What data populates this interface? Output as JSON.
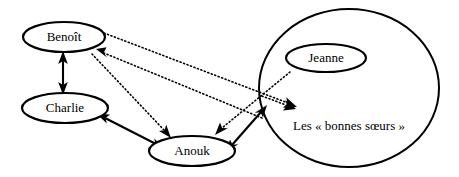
{
  "diagram": {
    "type": "relationship-network-diagram",
    "canvas": {
      "width": 459,
      "height": 177,
      "background": "#ffffff"
    },
    "stroke_color": "#000000",
    "nodes": [
      {
        "id": "benoit",
        "label": "Benoît",
        "shape": "ellipse",
        "cx": 64,
        "cy": 37,
        "rx": 41,
        "ry": 15,
        "font_size": 13
      },
      {
        "id": "charlie",
        "label": "Charlie",
        "shape": "ellipse",
        "cx": 65,
        "cy": 108,
        "rx": 43,
        "ry": 15,
        "font_size": 13
      },
      {
        "id": "anouk",
        "label": "Anouk",
        "shape": "ellipse",
        "cx": 192,
        "cy": 151,
        "rx": 43,
        "ry": 15,
        "font_size": 13
      },
      {
        "id": "jeanne",
        "label": "Jeanne",
        "shape": "ellipse",
        "cx": 326,
        "cy": 58,
        "rx": 40,
        "ry": 14,
        "font_size": 13
      },
      {
        "id": "bonnes-soeurs",
        "label": "Les « bonnes sœurs »",
        "shape": "ellipse",
        "cx": 349,
        "cy": 88,
        "rx": 90,
        "ry": 79,
        "label_cx": 349,
        "label_cy": 127,
        "font_size": 13
      }
    ],
    "edges": [
      {
        "id": "benoit-charlie",
        "from": "benoit",
        "to": "charlie",
        "style": "solid",
        "arrows": "both"
      },
      {
        "id": "charlie-anouk",
        "from": "charlie",
        "to": "anouk",
        "style": "solid",
        "arrows": "both"
      },
      {
        "id": "anouk-bonnes-soeurs",
        "from": "anouk",
        "to": "bonnes-soeurs",
        "style": "solid",
        "arrows": "both"
      },
      {
        "id": "benoit-bonnes-soeurs",
        "from": "benoit",
        "to": "bonnes-soeurs",
        "style": "dotted",
        "arrows": "forward"
      },
      {
        "id": "bonnes-soeurs-benoit",
        "from": "bonnes-soeurs",
        "to": "benoit",
        "style": "dotted",
        "arrows": "forward"
      },
      {
        "id": "benoit-anouk",
        "from": "benoit",
        "to": "anouk",
        "style": "dotted",
        "arrows": "forward"
      },
      {
        "id": "jeanne-anouk",
        "from": "jeanne",
        "to": "anouk",
        "style": "dotted",
        "arrows": "forward"
      },
      {
        "id": "jeanne-bonnes-soeurs",
        "from": "jeanne",
        "to": "bonnes-soeurs",
        "style": "dotted",
        "arrows": "forward"
      }
    ]
  }
}
